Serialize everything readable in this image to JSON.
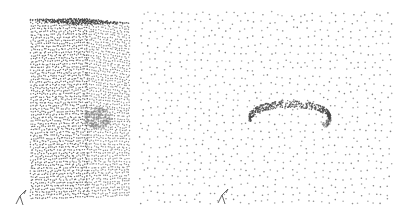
{
  "figure": {
    "panels": [
      {
        "id": "left",
        "subject": "point-cloud-box",
        "description": "Dense point cloud of a tall rectangular box with a grey cluster on the right face",
        "dot_color": "#3a3a3a",
        "cluster_color": "#8a8a8a",
        "axis_glyph": "xyz-axes-icon"
      },
      {
        "id": "right",
        "subject": "sparse-field-with-curved-tube",
        "description": "Sparse grid of points surrounding a dense curved tube",
        "dot_color": "#6a6a6a",
        "tube_color": "#4a4a4a",
        "axis_glyph": "xyz-axes-icon"
      }
    ]
  }
}
